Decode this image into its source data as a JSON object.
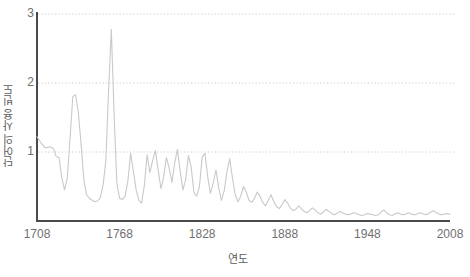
{
  "chart_data": {
    "type": "line",
    "title": "",
    "xlabel": "연도",
    "ylabel": "단어의 사용 빈도",
    "xlim": [
      1708,
      2008
    ],
    "ylim": [
      0,
      3
    ],
    "xticks": [
      1708,
      1768,
      1828,
      1888,
      1948,
      2008
    ],
    "xtick_labels": [
      "1708",
      "1768",
      "1828",
      "1888",
      "1948",
      "2008"
    ],
    "yticks": [
      1,
      2,
      3
    ],
    "ytick_labels": [
      "1",
      "2",
      "3"
    ],
    "grid": "horizontal-dotted",
    "legend": "none",
    "line_color": "#c9c9c9",
    "axis_color": "#4a4a4a",
    "grid_color": "#cccccc",
    "text_color": "#6f6f6f",
    "series": [
      {
        "name": "단어의 사용 빈도",
        "x": [
          1708,
          1711,
          1714,
          1716,
          1718,
          1720,
          1722,
          1724,
          1726,
          1728,
          1730,
          1732,
          1734,
          1736,
          1738,
          1740,
          1742,
          1744,
          1746,
          1748,
          1750,
          1752,
          1754,
          1756,
          1758,
          1760,
          1762,
          1764,
          1766,
          1768,
          1770,
          1772,
          1774,
          1776,
          1778,
          1780,
          1782,
          1784,
          1786,
          1788,
          1790,
          1792,
          1794,
          1796,
          1798,
          1800,
          1802,
          1804,
          1806,
          1808,
          1810,
          1812,
          1814,
          1816,
          1818,
          1820,
          1822,
          1824,
          1826,
          1828,
          1830,
          1832,
          1834,
          1836,
          1838,
          1840,
          1842,
          1844,
          1846,
          1848,
          1850,
          1852,
          1854,
          1856,
          1858,
          1860,
          1862,
          1864,
          1866,
          1868,
          1870,
          1872,
          1874,
          1876,
          1878,
          1880,
          1882,
          1884,
          1886,
          1888,
          1890,
          1892,
          1894,
          1896,
          1898,
          1900,
          1902,
          1904,
          1906,
          1908,
          1910,
          1912,
          1914,
          1916,
          1918,
          1920,
          1922,
          1924,
          1926,
          1928,
          1930,
          1932,
          1934,
          1936,
          1938,
          1940,
          1942,
          1944,
          1946,
          1948,
          1950,
          1952,
          1954,
          1956,
          1958,
          1960,
          1962,
          1964,
          1966,
          1968,
          1970,
          1972,
          1974,
          1976,
          1978,
          1980,
          1982,
          1984,
          1986,
          1988,
          1990,
          1992,
          1994,
          1996,
          1998,
          2000,
          2002,
          2004,
          2006,
          2008
        ],
        "y": [
          1.22,
          1.13,
          1.06,
          1.07,
          1.07,
          1.05,
          0.93,
          0.92,
          0.63,
          0.45,
          0.62,
          1.2,
          1.8,
          1.83,
          1.58,
          1.12,
          0.6,
          0.38,
          0.33,
          0.3,
          0.28,
          0.29,
          0.34,
          0.52,
          0.87,
          1.9,
          2.78,
          1.55,
          0.55,
          0.33,
          0.31,
          0.36,
          0.58,
          0.98,
          0.72,
          0.45,
          0.3,
          0.26,
          0.52,
          0.96,
          0.7,
          0.88,
          1.02,
          0.74,
          0.47,
          0.64,
          0.92,
          0.77,
          0.56,
          0.84,
          1.04,
          0.72,
          0.45,
          0.6,
          0.95,
          0.78,
          0.41,
          0.36,
          0.5,
          0.93,
          0.98,
          0.64,
          0.4,
          0.55,
          0.74,
          0.48,
          0.3,
          0.44,
          0.72,
          0.9,
          0.62,
          0.38,
          0.28,
          0.36,
          0.5,
          0.42,
          0.3,
          0.27,
          0.33,
          0.42,
          0.36,
          0.27,
          0.22,
          0.3,
          0.38,
          0.28,
          0.21,
          0.18,
          0.24,
          0.31,
          0.26,
          0.19,
          0.15,
          0.17,
          0.22,
          0.18,
          0.14,
          0.12,
          0.15,
          0.19,
          0.16,
          0.12,
          0.1,
          0.13,
          0.17,
          0.14,
          0.11,
          0.09,
          0.11,
          0.14,
          0.12,
          0.1,
          0.09,
          0.1,
          0.12,
          0.11,
          0.09,
          0.08,
          0.09,
          0.11,
          0.1,
          0.09,
          0.08,
          0.09,
          0.13,
          0.16,
          0.12,
          0.09,
          0.08,
          0.1,
          0.12,
          0.1,
          0.09,
          0.1,
          0.12,
          0.1,
          0.09,
          0.1,
          0.12,
          0.11,
          0.09,
          0.1,
          0.13,
          0.15,
          0.12,
          0.1,
          0.09,
          0.1,
          0.11,
          0.1
        ]
      }
    ]
  }
}
